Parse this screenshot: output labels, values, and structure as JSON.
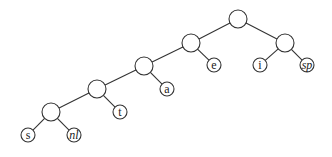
{
  "diagram": {
    "type": "binary-tree",
    "colors": {
      "stroke": "#333333",
      "fill": "#ffffff",
      "text": "#222222"
    },
    "nodes": [
      {
        "id": "root",
        "label": "",
        "x": 238,
        "y": 19,
        "r": 9,
        "leaf": false
      },
      {
        "id": "n1",
        "label": "",
        "x": 191,
        "y": 43,
        "r": 9,
        "leaf": false
      },
      {
        "id": "n2",
        "label": "",
        "x": 285,
        "y": 43,
        "r": 9,
        "leaf": false
      },
      {
        "id": "n3",
        "label": "",
        "x": 144,
        "y": 66,
        "r": 9,
        "leaf": false
      },
      {
        "id": "n4",
        "label": "",
        "x": 97,
        "y": 89,
        "r": 9,
        "leaf": false
      },
      {
        "id": "n5",
        "label": "",
        "x": 51,
        "y": 112,
        "r": 9,
        "leaf": false
      },
      {
        "id": "e",
        "label": "e",
        "x": 214,
        "y": 65,
        "r": 7,
        "leaf": true,
        "italic": false
      },
      {
        "id": "i",
        "label": "i",
        "x": 260,
        "y": 65,
        "r": 7,
        "leaf": true,
        "italic": false
      },
      {
        "id": "sp",
        "label": "sp",
        "x": 307,
        "y": 65,
        "r": 7,
        "leaf": true,
        "italic": true
      },
      {
        "id": "a",
        "label": "a",
        "x": 167,
        "y": 89,
        "r": 7,
        "leaf": true,
        "italic": false
      },
      {
        "id": "t",
        "label": "t",
        "x": 120,
        "y": 112,
        "r": 7,
        "leaf": true,
        "italic": false
      },
      {
        "id": "s",
        "label": "s",
        "x": 28,
        "y": 135,
        "r": 7,
        "leaf": true,
        "italic": false
      },
      {
        "id": "nl",
        "label": "nl",
        "x": 74,
        "y": 135,
        "r": 7,
        "leaf": true,
        "italic": true
      }
    ],
    "edges": [
      [
        "root",
        "n1"
      ],
      [
        "root",
        "n2"
      ],
      [
        "n1",
        "n3"
      ],
      [
        "n1",
        "e"
      ],
      [
        "n2",
        "i"
      ],
      [
        "n2",
        "sp"
      ],
      [
        "n3",
        "n4"
      ],
      [
        "n3",
        "a"
      ],
      [
        "n4",
        "n5"
      ],
      [
        "n4",
        "t"
      ],
      [
        "n5",
        "s"
      ],
      [
        "n5",
        "nl"
      ]
    ]
  }
}
